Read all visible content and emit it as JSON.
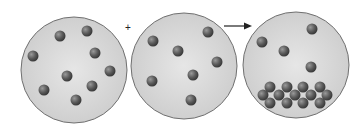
{
  "diagram": {
    "plus_symbol": "+",
    "colors": {
      "beaker_fill": "#d9d9d9",
      "beaker_stroke": "#707070",
      "particle": "#5a5a5a",
      "arrow": "#222222"
    },
    "beakers": [
      {
        "label": "solution-1",
        "cx": 74,
        "cy": 70,
        "r": 53,
        "particles": [
          [
            60,
            36
          ],
          [
            87,
            31
          ],
          [
            33,
            56
          ],
          [
            95,
            53
          ],
          [
            110,
            71
          ],
          [
            67,
            76
          ],
          [
            92,
            86
          ],
          [
            44,
            90
          ],
          [
            76,
            100
          ]
        ]
      },
      {
        "label": "solution-2",
        "cx": 184,
        "cy": 66,
        "r": 53,
        "particles": [
          [
            208,
            32
          ],
          [
            153,
            41
          ],
          [
            178,
            51
          ],
          [
            217,
            62
          ],
          [
            193,
            75
          ],
          [
            152,
            81
          ],
          [
            191,
            100
          ]
        ]
      },
      {
        "label": "mixture",
        "cx": 296,
        "cy": 65,
        "r": 53,
        "particles": [
          [
            312,
            29
          ],
          [
            262,
            42
          ],
          [
            284,
            51
          ],
          [
            311,
            67
          ]
        ],
        "precipitate": [
          [
            270,
            87
          ],
          [
            287,
            87
          ],
          [
            303,
            87
          ],
          [
            320,
            87
          ],
          [
            263,
            95
          ],
          [
            279,
            95
          ],
          [
            295,
            95
          ],
          [
            311,
            95
          ],
          [
            327,
            95
          ],
          [
            270,
            103
          ],
          [
            287,
            103
          ],
          [
            303,
            103
          ],
          [
            320,
            103
          ]
        ]
      }
    ]
  }
}
